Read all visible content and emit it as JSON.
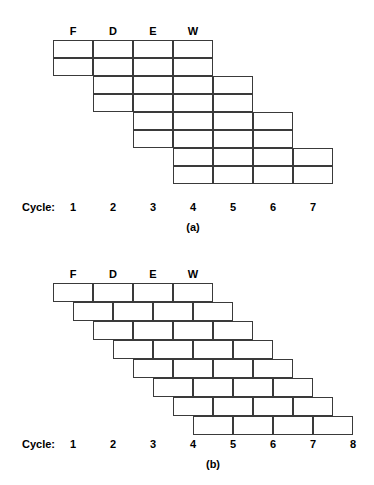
{
  "figures": [
    {
      "id": "a",
      "caption": "(a)",
      "stage_headers": [
        "F",
        "D",
        "E",
        "W"
      ],
      "cycle_caption": "Cycle:",
      "cycle_numbers": [
        "1",
        "2",
        "3",
        "4",
        "5",
        "6",
        "7"
      ],
      "layout": {
        "origin_x": 53,
        "origin_y": 40,
        "cell_width": 40,
        "cell_height": 18,
        "rows_per_instruction": 2,
        "stages_per_instruction": 4,
        "column_step_per_instruction": 1,
        "instruction_count": 4,
        "header_y": 24,
        "cycle_row_y": 200,
        "caption_y": 220,
        "grid_line_color": "#3a3a3a",
        "cell_fill": "#ffffff"
      },
      "instructions": [
        {
          "index": 0,
          "start_column": 0,
          "start_row": 0,
          "stages": [
            "F",
            "D",
            "E",
            "W"
          ]
        },
        {
          "index": 1,
          "start_column": 1,
          "start_row": 2,
          "stages": [
            "F",
            "D",
            "E",
            "W"
          ]
        },
        {
          "index": 2,
          "start_column": 2,
          "start_row": 4,
          "stages": [
            "F",
            "D",
            "E",
            "W"
          ]
        },
        {
          "index": 3,
          "start_column": 3,
          "start_row": 6,
          "stages": [
            "F",
            "D",
            "E",
            "W"
          ]
        }
      ]
    },
    {
      "id": "b",
      "caption": "(b)",
      "stage_headers": [
        "F",
        "D",
        "E",
        "W"
      ],
      "cycle_caption": "Cycle:",
      "cycle_numbers": [
        "1",
        "2",
        "3",
        "4",
        "5",
        "6",
        "7",
        "8"
      ],
      "layout": {
        "origin_x": 53,
        "origin_y": 38,
        "cell_width": 40,
        "cell_height": 19,
        "stages_per_instruction": 4,
        "row_offset_x": 20,
        "instruction_count": 8,
        "header_y": 22,
        "cycle_row_y": 192,
        "caption_y": 212,
        "grid_line_color": "#3a3a3a",
        "cell_fill": "#ffffff"
      },
      "instructions": [
        {
          "index": 0,
          "row": 0,
          "offset_steps": 0,
          "stages": [
            "F",
            "D",
            "E",
            "W"
          ]
        },
        {
          "index": 1,
          "row": 1,
          "offset_steps": 1,
          "stages": [
            "F",
            "D",
            "E",
            "W"
          ]
        },
        {
          "index": 2,
          "row": 2,
          "offset_steps": 2,
          "stages": [
            "F",
            "D",
            "E",
            "W"
          ]
        },
        {
          "index": 3,
          "row": 3,
          "offset_steps": 3,
          "stages": [
            "F",
            "D",
            "E",
            "W"
          ]
        },
        {
          "index": 4,
          "row": 4,
          "offset_steps": 4,
          "stages": [
            "F",
            "D",
            "E",
            "W"
          ]
        },
        {
          "index": 5,
          "row": 5,
          "offset_steps": 5,
          "stages": [
            "F",
            "D",
            "E",
            "W"
          ]
        },
        {
          "index": 6,
          "row": 6,
          "offset_steps": 6,
          "stages": [
            "F",
            "D",
            "E",
            "W"
          ]
        },
        {
          "index": 7,
          "row": 7,
          "offset_steps": 7,
          "stages": [
            "F",
            "D",
            "E",
            "W"
          ]
        }
      ]
    }
  ]
}
